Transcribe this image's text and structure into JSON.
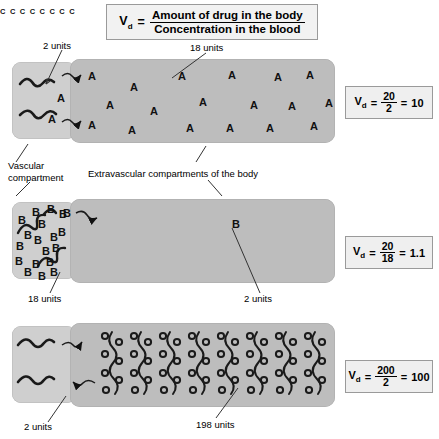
{
  "figure": {
    "formula": {
      "symbol": "V",
      "subscript": "d",
      "equals": "=",
      "numerator": "Amount of drug in the body",
      "denominator": "Concentration in the blood"
    },
    "labels": {
      "vascular_compartment": "Vascular\ncompartment",
      "vascular_compartment_line1": "Vascular",
      "vascular_compartment_line2": "compartment",
      "extravascular_compartments": "Extravascular compartments of the body"
    },
    "rows": [
      {
        "drug": "A",
        "vascular_units": "2 units",
        "extravascular_units": "18 units",
        "result": {
          "symbol": "V",
          "subscript": "d",
          "equals": "=",
          "numerator": "20",
          "denominator": "2",
          "equals2": "=",
          "value": "10"
        }
      },
      {
        "drug": "B",
        "vascular_units": "18 units",
        "extravascular_units": "2 units",
        "result": {
          "symbol": "V",
          "subscript": "d",
          "equals": "=",
          "numerator": "20",
          "denominator": "18",
          "equals2": "=",
          "value": "1.1"
        }
      },
      {
        "drug": "C",
        "vascular_units": "2 units",
        "extravascular_units": "198 units",
        "result": {
          "symbol": "V",
          "subscript": "d",
          "equals": "=",
          "numerator": "200",
          "denominator": "2",
          "equals2": "=",
          "value": "100"
        }
      }
    ],
    "colors": {
      "vascular_fill": "#cfcfcf",
      "extravascular_fill": "#bdbdbd",
      "box_fill": "#f2f2f2",
      "box_border": "#9a9a9a",
      "ink": "#111111",
      "background": "#ffffff"
    }
  }
}
